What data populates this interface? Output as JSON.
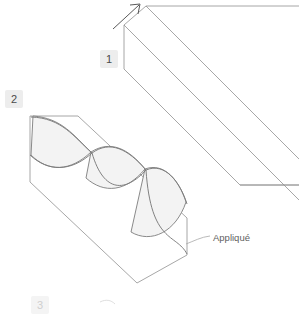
{
  "figure": {
    "type": "sewing-instruction-diagram",
    "background_color": "#ffffff",
    "line_color": "#8c8c8c",
    "accent_line_color": "#707070",
    "fill_color": "#f2f2f2",
    "width": 299,
    "height": 305
  },
  "steps": [
    {
      "number": "1",
      "name": "fold-strip",
      "badge_position": {
        "x": 100,
        "y": 50
      },
      "has_arrow": true,
      "arrow": {
        "name": "fold-direction-arrow",
        "direction": "up-right",
        "from": {
          "x": 113,
          "y": 29
        },
        "to": {
          "x": 140,
          "y": 4
        }
      }
    },
    {
      "number": "2",
      "name": "applique-strip",
      "badge_position": {
        "x": 5,
        "y": 90
      },
      "has_arrow": false
    },
    {
      "number": "3",
      "name": "next-step-partial",
      "badge_position": {
        "x": 31,
        "y": 296
      },
      "has_arrow": false
    }
  ],
  "callouts": [
    {
      "name": "applique-callout",
      "label": "Appliqué",
      "label_position": {
        "x": 213,
        "y": 232
      },
      "leader_from": {
        "x": 187,
        "y": 243
      },
      "leader_to": {
        "x": 210,
        "y": 237
      }
    }
  ],
  "shapes": {
    "step1_strip": {
      "name": "folded-fabric-strip",
      "description": "long parallelogram strip running diagonally off the right edge",
      "outer_path": "M 146,5 L 299,5 M 146,5 L 299,158 M 125,25 L 299,25 M 125,25 L 125,69",
      "fold_lines": 3
    },
    "step2_strip": {
      "name": "applique-fabric-strip",
      "description": "diagonal parallelogram with a sinuous appliqué wave forming three leaf shapes",
      "wave_lobes": 3
    }
  }
}
